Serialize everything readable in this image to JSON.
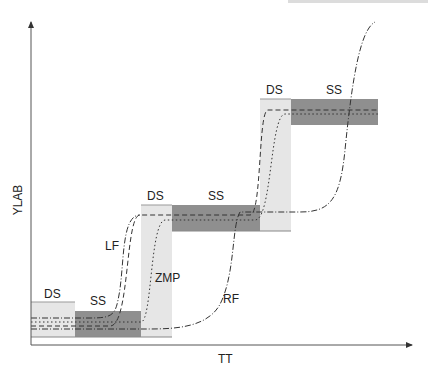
{
  "header": {
    "note": ""
  },
  "axes": {
    "x_label": "TT",
    "y_label": "YLAB"
  },
  "phases": [
    {
      "label": "DS",
      "kind": "double-support"
    },
    {
      "label": "SS",
      "kind": "single-support"
    },
    {
      "label": "DS",
      "kind": "double-support"
    },
    {
      "label": "SS",
      "kind": "single-support"
    },
    {
      "label": "DS",
      "kind": "double-support"
    },
    {
      "label": "SS",
      "kind": "single-support"
    }
  ],
  "curves": [
    {
      "label": "LF",
      "style": "dashed"
    },
    {
      "label": "ZMP",
      "style": "dotted"
    },
    {
      "label": "RF",
      "style": "dash-dot"
    }
  ],
  "colors": {
    "ds_fill": "#e6e6e6",
    "ss_fill": "#8f8f8f",
    "line": "#333333",
    "axis": "#555555"
  }
}
